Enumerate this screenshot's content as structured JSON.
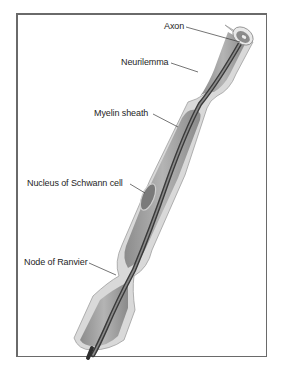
{
  "diagram": {
    "type": "anatomical-illustration",
    "labels": [
      {
        "id": "axon",
        "text": "Axon"
      },
      {
        "id": "neurilemma",
        "text": "Neurilemma"
      },
      {
        "id": "myelin-sheath",
        "text": "Myelin sheath"
      },
      {
        "id": "nucleus-schwann",
        "text": "Nucleus of Schwann cell"
      },
      {
        "id": "node-ranvier",
        "text": "Node of Ranvier"
      }
    ]
  },
  "colors": {
    "neurilemma": "#d6d6d6",
    "myelin": "#9a9a9a",
    "axon": "#5a5a5a",
    "nucleus": "#808080",
    "frame": "#6a6a6a",
    "text": "#1e1e1e"
  }
}
